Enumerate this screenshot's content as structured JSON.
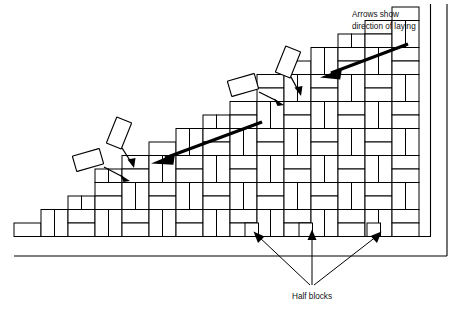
{
  "figure": {
    "background_color": "#ffffff",
    "line_color": "#000000",
    "width": 464,
    "height": 310
  },
  "annotations": {
    "direction_label_line1": "Arrows show",
    "direction_label_line2": "direction of laying",
    "half_blocks_label": "Half blocks"
  },
  "diagram": {
    "pattern_name": "basketweave-herringbone",
    "module_width": 27,
    "module_height": 13.5,
    "laying_face_description": "stepped diagonal working face rising left to right",
    "direction_arrow_count": 2,
    "half_block_pointer_count": 3,
    "loose_block_count": 4
  },
  "chart_data": {
    "type": "diagram",
    "elements": [
      {
        "name": "paving-field",
        "description": "laid blocks in herringbone bond"
      },
      {
        "name": "stepped-working-face",
        "description": "stepped diagonal edge where laying advances"
      },
      {
        "name": "loose-blocks",
        "description": "four blocks shown mid-placement above the working face"
      },
      {
        "name": "direction-arrows",
        "description": "two heavy arrows pointing down-left along the laying direction"
      },
      {
        "name": "half-blocks",
        "description": "three half blocks along the bottom course edge"
      },
      {
        "name": "kerb-frame",
        "description": "outer restraint lines at bottom and right"
      }
    ]
  }
}
